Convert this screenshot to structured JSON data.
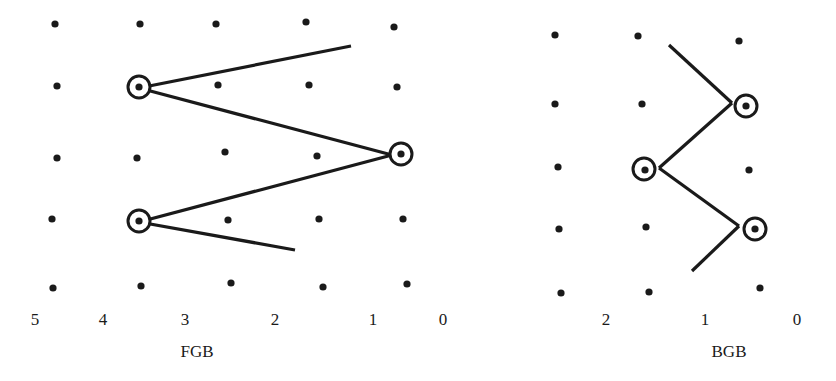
{
  "colors": {
    "ink": "#1a1a1a",
    "background": "#ffffff"
  },
  "panels": [
    {
      "name": "FGB",
      "title": "FGB",
      "title_pos": [
        197,
        352
      ],
      "axis_labels": [
        {
          "text": "5",
          "x": 35,
          "y": 320
        },
        {
          "text": "4",
          "x": 103,
          "y": 320
        },
        {
          "text": "3",
          "x": 185,
          "y": 320
        },
        {
          "text": "2",
          "x": 275,
          "y": 320
        },
        {
          "text": "1",
          "x": 373,
          "y": 320
        },
        {
          "text": "0",
          "x": 443,
          "y": 320
        }
      ],
      "dots": [
        [
          55,
          24
        ],
        [
          140,
          24
        ],
        [
          216,
          24
        ],
        [
          306,
          22
        ],
        [
          394,
          27
        ],
        [
          57,
          86
        ],
        [
          139,
          87
        ],
        [
          218,
          85
        ],
        [
          309,
          85
        ],
        [
          397,
          87
        ],
        [
          57,
          158
        ],
        [
          137,
          158
        ],
        [
          225,
          152
        ],
        [
          317,
          156
        ],
        [
          401,
          154
        ],
        [
          52,
          219
        ],
        [
          139,
          221
        ],
        [
          228,
          220
        ],
        [
          319,
          219
        ],
        [
          403,
          219
        ],
        [
          53,
          288
        ],
        [
          141,
          286
        ],
        [
          231,
          283
        ],
        [
          323,
          287
        ],
        [
          407,
          284
        ]
      ],
      "circled": [
        [
          139,
          87
        ],
        [
          401,
          154
        ],
        [
          139,
          221
        ]
      ],
      "path_segments": [
        [
          [
            351,
            46
          ],
          [
            139,
            88
          ]
        ],
        [
          [
            139,
            88
          ],
          [
            392,
            155
          ]
        ],
        [
          [
            392,
            155
          ],
          [
            139,
            222
          ]
        ],
        [
          [
            139,
            222
          ],
          [
            295,
            250
          ]
        ]
      ]
    },
    {
      "name": "BGB",
      "title": "BGB",
      "title_pos": [
        729,
        352
      ],
      "axis_labels": [
        {
          "text": "2",
          "x": 606,
          "y": 320
        },
        {
          "text": "1",
          "x": 705,
          "y": 320
        },
        {
          "text": "0",
          "x": 797,
          "y": 320
        }
      ],
      "dots": [
        [
          555,
          35
        ],
        [
          638,
          36
        ],
        [
          739,
          41
        ],
        [
          555,
          104
        ],
        [
          642,
          104
        ],
        [
          746,
          106
        ],
        [
          558,
          167
        ],
        [
          645,
          170
        ],
        [
          749,
          170
        ],
        [
          559,
          229
        ],
        [
          646,
          227
        ],
        [
          755,
          229
        ],
        [
          561,
          293
        ],
        [
          649,
          292
        ],
        [
          760,
          288
        ]
      ],
      "circled": [
        [
          746,
          106
        ],
        [
          644,
          169
        ],
        [
          755,
          229
        ]
      ],
      "path_segments": [
        [
          [
            669,
            45
          ],
          [
            732,
            103
          ]
        ],
        [
          [
            732,
            103
          ],
          [
            659,
            168
          ]
        ],
        [
          [
            659,
            168
          ],
          [
            739,
            226
          ]
        ],
        [
          [
            739,
            226
          ],
          [
            692,
            271
          ]
        ]
      ]
    }
  ]
}
